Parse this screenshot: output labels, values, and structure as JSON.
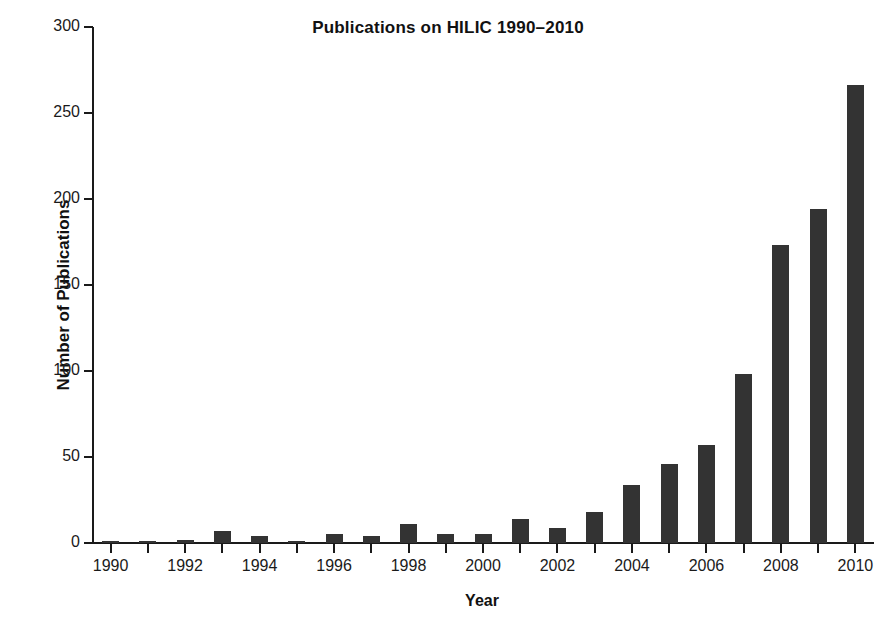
{
  "chart_data": {
    "type": "bar",
    "title": "Publications on HILIC 1990–2010",
    "xlabel": "Year",
    "ylabel": "Number of Publications",
    "categories": [
      "1990",
      "1991",
      "1992",
      "1993",
      "1994",
      "1995",
      "1996",
      "1997",
      "1998",
      "1999",
      "2000",
      "2001",
      "2002",
      "2003",
      "2004",
      "2005",
      "2006",
      "2007",
      "2008",
      "2009",
      "2010"
    ],
    "values": [
      1,
      1,
      2,
      7,
      4,
      1,
      5,
      4,
      11,
      5,
      5,
      14,
      9,
      18,
      34,
      46,
      57,
      98,
      173,
      194,
      266
    ],
    "ylim": [
      0,
      300
    ],
    "yticks": [
      0,
      50,
      100,
      150,
      200,
      250,
      300
    ],
    "xtick_labels": [
      "1990",
      "1992",
      "1994",
      "1996",
      "1998",
      "2000",
      "2002",
      "2004",
      "2006",
      "2008",
      "2010"
    ],
    "grid": false,
    "legend": false,
    "bar_color": "#333333",
    "axis_color": "#1a1a1a",
    "background": "#ffffff"
  },
  "figure": {
    "title": "Publications on HILIC 1990–2010",
    "x_axis_title": "Year",
    "y_axis_title": "Number of Publications"
  }
}
